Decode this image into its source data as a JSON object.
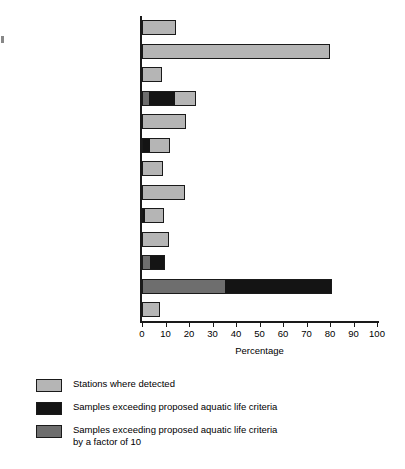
{
  "chart_data": {
    "type": "bar",
    "orientation": "horizontal",
    "stacked": true,
    "title": "",
    "xlabel": "Percentage",
    "ylabel": "",
    "xlim": [
      0,
      100
    ],
    "grid": false,
    "legend_position": "below",
    "tick_labels": [
      "0",
      "10",
      "20",
      "30",
      "40",
      "50",
      "60",
      "70",
      "80",
      "90",
      "100"
    ],
    "tick_values": [
      0,
      10,
      20,
      30,
      40,
      50,
      60,
      70,
      80,
      90,
      100
    ],
    "categories": [
      "Dichlorobromomethane",
      "Chloroform",
      "Trichlorofluoromethane",
      "1,2-Dichloroethene",
      "1,1,1-Trichloroethane",
      "1,1,2,2-Tetrachloroethane",
      "1,1-Dichloroethene",
      "Benzene",
      "1,2-Dichlorobenzene",
      "Toluene",
      "Pentachlorophenol",
      "Phthalate esters",
      "Naphthalene"
    ],
    "series": [
      {
        "name": "Stations where detected",
        "color": "#b5b5b5",
        "values": [
          13.5,
          79,
          7.5,
          22,
          18,
          11,
          8,
          17.5,
          8.5,
          10.5,
          0,
          0,
          7
        ]
      },
      {
        "name": "Samples exceeding proposed aquatic life criteria",
        "color": "#141414",
        "values": [
          0,
          0,
          0,
          13.5,
          0,
          3,
          0,
          0,
          1,
          0,
          9,
          80,
          0
        ]
      },
      {
        "name": "Samples exceeding proposed aquatic life criteria by a factor of 10",
        "color": "#6e6e6e",
        "values": [
          0,
          0,
          0,
          2.5,
          0,
          0,
          0,
          0,
          0,
          0,
          3,
          35,
          0
        ]
      }
    ],
    "bars": [
      {
        "category": "Dichlorobromomethane",
        "segments": [
          {
            "series": "detected",
            "start": 0,
            "end": 13.5
          }
        ]
      },
      {
        "category": "Chloroform",
        "segments": [
          {
            "series": "detected",
            "start": 0,
            "end": 79
          }
        ]
      },
      {
        "category": "Trichlorofluoromethane",
        "segments": [
          {
            "series": "detected",
            "start": 0,
            "end": 7.5
          }
        ]
      },
      {
        "category": "1,2-Dichloroethene",
        "segments": [
          {
            "series": "factor10",
            "start": 0,
            "end": 2.5
          },
          {
            "series": "exceeding",
            "start": 2.5,
            "end": 13.5
          },
          {
            "series": "detected",
            "start": 13.5,
            "end": 22
          }
        ]
      },
      {
        "category": "1,1,1-Trichloroethane",
        "segments": [
          {
            "series": "detected",
            "start": 0,
            "end": 18
          }
        ]
      },
      {
        "category": "1,1,2,2-Tetrachloroethane",
        "segments": [
          {
            "series": "exceeding",
            "start": 0,
            "end": 3
          },
          {
            "series": "detected",
            "start": 3,
            "end": 11
          }
        ]
      },
      {
        "category": "1,1-Dichloroethene",
        "segments": [
          {
            "series": "detected",
            "start": 0,
            "end": 8
          }
        ]
      },
      {
        "category": "Benzene",
        "segments": [
          {
            "series": "detected",
            "start": 0,
            "end": 17.5
          }
        ]
      },
      {
        "category": "1,2-Dichlorobenzene",
        "segments": [
          {
            "series": "exceeding",
            "start": 0,
            "end": 1
          },
          {
            "series": "detected",
            "start": 1,
            "end": 8.5
          }
        ]
      },
      {
        "category": "Toluene",
        "segments": [
          {
            "series": "detected",
            "start": 0,
            "end": 10.5
          }
        ]
      },
      {
        "category": "Pentachlorophenol",
        "segments": [
          {
            "series": "factor10",
            "start": 0,
            "end": 3
          },
          {
            "series": "exceeding",
            "start": 3,
            "end": 9
          }
        ]
      },
      {
        "category": "Phthalate esters",
        "segments": [
          {
            "series": "factor10",
            "start": 0,
            "end": 35
          },
          {
            "series": "exceeding",
            "start": 35,
            "end": 80
          }
        ]
      },
      {
        "category": "Naphthalene",
        "segments": [
          {
            "series": "detected",
            "start": 0,
            "end": 7
          }
        ]
      }
    ]
  },
  "legend": {
    "items": [
      {
        "swatch": "detected",
        "label": "Stations where detected"
      },
      {
        "swatch": "exceeding",
        "label": "Samples exceeding proposed aquatic life criteria"
      },
      {
        "swatch": "factor10",
        "label": "Samples exceeding proposed aquatic life criteria\nby a factor of 10"
      }
    ]
  },
  "colors": {
    "detected": "#b5b5b5",
    "exceeding": "#141414",
    "factor10": "#6e6e6e",
    "axis": "#1a1a1a",
    "background": "#ffffff"
  }
}
